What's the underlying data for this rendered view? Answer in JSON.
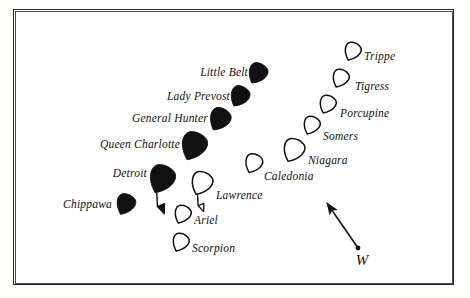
{
  "figure": {
    "background_color": "#ffffff",
    "frame_color": "#2a2a2a",
    "ink_color": "#111111"
  },
  "wind": {
    "label": "W",
    "arrow_from_x": 358,
    "arrow_from_y": 248,
    "arrow_to_x": 327,
    "arrow_to_y": 203,
    "label_x": 362,
    "label_y": 252
  },
  "chart_data": {
    "type": "scatter",
    "title": "",
    "xlabel": "",
    "ylabel": "",
    "legend": [
      {
        "name": "British squadron",
        "marker": "filled-ship",
        "fill": "#111111"
      },
      {
        "name": "American squadron",
        "marker": "outline-ship",
        "fill": "#ffffff"
      }
    ],
    "annotations": [
      {
        "text": "W",
        "kind": "wind-direction-arrow"
      }
    ],
    "series": [
      {
        "name": "British squadron",
        "style": "filled",
        "points": [
          {
            "label": "Little Belt",
            "x": 257,
            "y": 74,
            "size": 20,
            "angle": 210,
            "flag": false,
            "label_x": 248,
            "label_y": 73,
            "label_side": "left"
          },
          {
            "label": "Lady Prevost",
            "x": 239,
            "y": 97,
            "size": 20,
            "angle": 210,
            "flag": false,
            "label_x": 230,
            "label_y": 97,
            "label_side": "left"
          },
          {
            "label": "General Hunter",
            "x": 219,
            "y": 120,
            "size": 22,
            "angle": 210,
            "flag": false,
            "label_x": 208,
            "label_y": 119,
            "label_side": "left"
          },
          {
            "label": "Queen Charlotte",
            "x": 193,
            "y": 147,
            "size": 27,
            "angle": 205,
            "flag": false,
            "label_x": 180,
            "label_y": 145,
            "label_side": "left"
          },
          {
            "label": "Detroit",
            "x": 161,
            "y": 180,
            "size": 27,
            "angle": 205,
            "flag": true,
            "label_x": 147,
            "label_y": 174,
            "label_side": "left"
          },
          {
            "label": "Chippawa",
            "x": 125,
            "y": 205,
            "size": 20,
            "angle": 205,
            "flag": false,
            "label_x": 112,
            "label_y": 205,
            "label_side": "left"
          }
        ]
      },
      {
        "name": "American squadron",
        "style": "outline",
        "points": [
          {
            "label": "Trippe",
            "x": 352,
            "y": 52,
            "size": 17,
            "angle": 205,
            "flag": false,
            "label_x": 364,
            "label_y": 57,
            "label_side": "right"
          },
          {
            "label": "Tigress",
            "x": 340,
            "y": 79,
            "size": 17,
            "angle": 205,
            "flag": false,
            "label_x": 355,
            "label_y": 87,
            "label_side": "right"
          },
          {
            "label": "Porcupine",
            "x": 327,
            "y": 105,
            "size": 17,
            "angle": 205,
            "flag": false,
            "label_x": 340,
            "label_y": 114,
            "label_side": "right"
          },
          {
            "label": "Somers",
            "x": 311,
            "y": 126,
            "size": 17,
            "angle": 205,
            "flag": false,
            "label_x": 323,
            "label_y": 137,
            "label_side": "right"
          },
          {
            "label": "Niagara",
            "x": 293,
            "y": 151,
            "size": 22,
            "angle": 205,
            "flag": false,
            "label_x": 308,
            "label_y": 161,
            "label_side": "right"
          },
          {
            "label": "Caledonia",
            "x": 253,
            "y": 164,
            "size": 18,
            "angle": 205,
            "flag": false,
            "label_x": 264,
            "label_y": 177,
            "label_side": "right"
          },
          {
            "label": "Lawrence",
            "x": 201,
            "y": 184,
            "size": 22,
            "angle": 205,
            "flag": true,
            "label_x": 216,
            "label_y": 196,
            "label_side": "right"
          },
          {
            "label": "Ariel",
            "x": 182,
            "y": 215,
            "size": 17,
            "angle": 205,
            "flag": false,
            "label_x": 194,
            "label_y": 221,
            "label_side": "right"
          },
          {
            "label": "Scorpion",
            "x": 180,
            "y": 243,
            "size": 17,
            "angle": 205,
            "flag": false,
            "label_x": 192,
            "label_y": 249,
            "label_side": "right"
          }
        ]
      }
    ]
  }
}
